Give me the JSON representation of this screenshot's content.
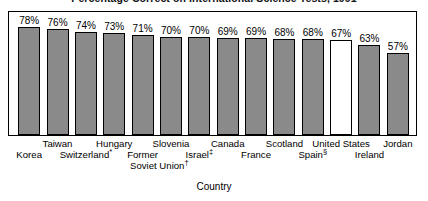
{
  "chart_data": {
    "type": "bar",
    "title": "Percentage Correct on International Science Tests, 1991",
    "xlabel": "Country",
    "ylabel": "",
    "ylim": [
      0,
      100
    ],
    "grid": false,
    "legend": "none",
    "categories": [
      "Korea",
      "Taiwan",
      "Switzerland*",
      "Hungary",
      "Former Soviet Union†",
      "Slovenia",
      "Israel‡",
      "Canada",
      "France",
      "Scotland",
      "Spain§",
      "United States",
      "Ireland",
      "Jordan"
    ],
    "values": [
      78,
      76,
      74,
      73,
      71,
      70,
      70,
      69,
      69,
      68,
      68,
      67,
      63,
      57
    ],
    "value_labels": [
      "78%",
      "76%",
      "74%",
      "73%",
      "71%",
      "70%",
      "70%",
      "69%",
      "69%",
      "68%",
      "68%",
      "67%",
      "63%",
      "57%"
    ],
    "highlight_category": "United States",
    "highlight_style": "unfilled-white",
    "bar_fill_color": "#8a8a8a",
    "bar_edge_color": "#000000",
    "highlight_fill_color": "#ffffff",
    "background_color": "#ffffff"
  },
  "bars": [
    {
      "label": "Korea",
      "label_main": "Korea",
      "marker": "",
      "value": 78,
      "value_label": "78%",
      "row": 0,
      "hollow": false
    },
    {
      "label": "Taiwan",
      "label_main": "Taiwan",
      "marker": "",
      "value": 76,
      "value_label": "76%",
      "row": 1,
      "hollow": false
    },
    {
      "label": "Switzerland*",
      "label_main": "Switzerland",
      "marker": "*",
      "value": 74,
      "value_label": "74%",
      "row": 0,
      "hollow": false
    },
    {
      "label": "Hungary",
      "label_main": "Hungary",
      "marker": "",
      "value": 73,
      "value_label": "73%",
      "row": 1,
      "hollow": false
    },
    {
      "label": "Former Soviet Union†",
      "label_main": "Former",
      "marker": "",
      "value": 71,
      "value_label": "71%",
      "row": 0,
      "hollow": false
    },
    {
      "label": "Slovenia",
      "label_main": "Slovenia",
      "marker": "",
      "value": 70,
      "value_label": "70%",
      "row": 1,
      "hollow": false
    },
    {
      "label": "Israel‡",
      "label_main": "Israel",
      "marker": "‡",
      "value": 70,
      "value_label": "70%",
      "row": 0,
      "hollow": false
    },
    {
      "label": "Canada",
      "label_main": "Canada",
      "marker": "",
      "value": 69,
      "value_label": "69%",
      "row": 1,
      "hollow": false
    },
    {
      "label": "France",
      "label_main": "France",
      "marker": "",
      "value": 69,
      "value_label": "69%",
      "row": 0,
      "hollow": false
    },
    {
      "label": "Scotland",
      "label_main": "Scotland",
      "marker": "",
      "value": 68,
      "value_label": "68%",
      "row": 1,
      "hollow": false
    },
    {
      "label": "Spain§",
      "label_main": "Spain",
      "marker": "§",
      "value": 68,
      "value_label": "68%",
      "row": 0,
      "hollow": false
    },
    {
      "label": "United States",
      "label_main": "United States",
      "marker": "",
      "value": 67,
      "value_label": "67%",
      "row": 1,
      "hollow": true
    },
    {
      "label": "Ireland",
      "label_main": "Ireland",
      "marker": "",
      "value": 63,
      "value_label": "63%",
      "row": 0,
      "hollow": false
    },
    {
      "label": "Jordan",
      "label_main": "Jordan",
      "marker": "",
      "value": 57,
      "value_label": "57%",
      "row": 1,
      "hollow": false
    }
  ],
  "extra_labels": [
    {
      "text": "Soviet Union†",
      "main": "Soviet Union",
      "marker": "†",
      "x_pct": 37.0,
      "row": 2
    }
  ],
  "axis": {
    "x_title": "Country"
  }
}
